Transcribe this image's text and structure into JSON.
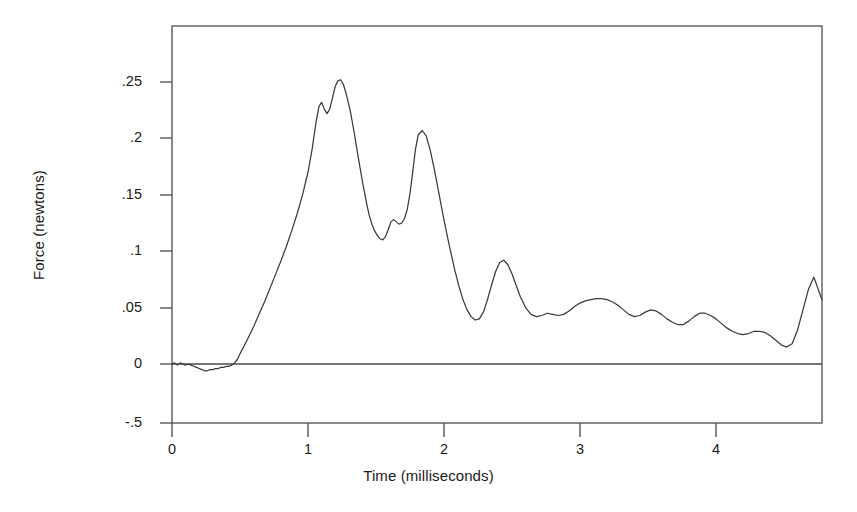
{
  "chart_data": {
    "type": "line",
    "title": "",
    "xlabel": "Time (milliseconds)",
    "ylabel": "Force (newtons)",
    "xlim": [
      0,
      4.78
    ],
    "ylim": [
      -0.05,
      0.2803
    ],
    "xticks": [
      0,
      1,
      2,
      3,
      4
    ],
    "xticklabels": [
      "0",
      "1",
      "2",
      "3",
      "4"
    ],
    "yticks": [
      -0.05,
      0,
      0.05,
      0.1,
      0.15,
      0.2,
      0.25
    ],
    "yticklabels": [
      "-.5",
      "0",
      ".05",
      ".1",
      ".15",
      ".2",
      ".25"
    ],
    "grid": false,
    "legend": null,
    "frame": true,
    "zero_reference_line": 0,
    "line_color": "#3a3a3a",
    "series": [
      {
        "name": "Force trace",
        "x": [
          0.0,
          0.02,
          0.04,
          0.06,
          0.08,
          0.1,
          0.12,
          0.14,
          0.16,
          0.18,
          0.2,
          0.22,
          0.24,
          0.26,
          0.28,
          0.3,
          0.32,
          0.34,
          0.36,
          0.38,
          0.4,
          0.42,
          0.44,
          0.46,
          0.48,
          0.5,
          0.53,
          0.56,
          0.6,
          0.64,
          0.68,
          0.72,
          0.76,
          0.8,
          0.84,
          0.88,
          0.92,
          0.96,
          1.0,
          1.03,
          1.06,
          1.08,
          1.1,
          1.12,
          1.14,
          1.16,
          1.18,
          1.2,
          1.22,
          1.24,
          1.26,
          1.28,
          1.31,
          1.34,
          1.37,
          1.4,
          1.43,
          1.45,
          1.47,
          1.49,
          1.51,
          1.53,
          1.55,
          1.57,
          1.59,
          1.61,
          1.63,
          1.65,
          1.67,
          1.69,
          1.71,
          1.73,
          1.75,
          1.77,
          1.79,
          1.81,
          1.84,
          1.87,
          1.9,
          1.93,
          1.96,
          1.99,
          2.02,
          2.05,
          2.08,
          2.11,
          2.14,
          2.17,
          2.2,
          2.23,
          2.26,
          2.29,
          2.32,
          2.35,
          2.38,
          2.41,
          2.44,
          2.47,
          2.5,
          2.53,
          2.56,
          2.6,
          2.64,
          2.68,
          2.72,
          2.76,
          2.8,
          2.84,
          2.88,
          2.92,
          2.96,
          3.0,
          3.04,
          3.08,
          3.12,
          3.16,
          3.2,
          3.24,
          3.28,
          3.32,
          3.36,
          3.4,
          3.44,
          3.48,
          3.52,
          3.56,
          3.6,
          3.64,
          3.68,
          3.72,
          3.76,
          3.8,
          3.84,
          3.88,
          3.92,
          3.96,
          4.0,
          4.04,
          4.08,
          4.12,
          4.16,
          4.2,
          4.24,
          4.28,
          4.32,
          4.36,
          4.4,
          4.44,
          4.48,
          4.52,
          4.56,
          4.6,
          4.64,
          4.68,
          4.72,
          4.78
        ],
        "y": [
          0.0,
          0.001,
          -0.001,
          0.001,
          0.0,
          -0.001,
          0.0,
          -0.001,
          -0.002,
          -0.003,
          -0.004,
          -0.005,
          -0.006,
          -0.006,
          -0.005,
          -0.005,
          -0.004,
          -0.004,
          -0.003,
          -0.003,
          -0.002,
          -0.002,
          -0.001,
          0.001,
          0.004,
          0.009,
          0.016,
          0.023,
          0.033,
          0.044,
          0.055,
          0.067,
          0.079,
          0.091,
          0.104,
          0.118,
          0.133,
          0.15,
          0.17,
          0.19,
          0.215,
          0.228,
          0.232,
          0.226,
          0.222,
          0.226,
          0.236,
          0.246,
          0.251,
          0.252,
          0.248,
          0.24,
          0.225,
          0.205,
          0.183,
          0.162,
          0.143,
          0.132,
          0.124,
          0.118,
          0.114,
          0.111,
          0.11,
          0.113,
          0.119,
          0.126,
          0.128,
          0.126,
          0.124,
          0.125,
          0.129,
          0.137,
          0.151,
          0.17,
          0.19,
          0.203,
          0.207,
          0.202,
          0.189,
          0.172,
          0.153,
          0.134,
          0.116,
          0.099,
          0.083,
          0.069,
          0.057,
          0.048,
          0.042,
          0.039,
          0.04,
          0.046,
          0.057,
          0.07,
          0.082,
          0.09,
          0.092,
          0.088,
          0.08,
          0.07,
          0.06,
          0.05,
          0.044,
          0.042,
          0.043,
          0.045,
          0.044,
          0.043,
          0.044,
          0.047,
          0.051,
          0.054,
          0.056,
          0.057,
          0.058,
          0.058,
          0.057,
          0.055,
          0.052,
          0.048,
          0.044,
          0.042,
          0.043,
          0.046,
          0.048,
          0.047,
          0.044,
          0.04,
          0.037,
          0.035,
          0.035,
          0.038,
          0.042,
          0.045,
          0.045,
          0.043,
          0.04,
          0.036,
          0.032,
          0.029,
          0.027,
          0.026,
          0.027,
          0.029,
          0.029,
          0.028,
          0.025,
          0.021,
          0.017,
          0.015,
          0.018,
          0.03,
          0.048,
          0.066,
          0.077,
          0.057
        ]
      }
    ],
    "annotations": []
  }
}
